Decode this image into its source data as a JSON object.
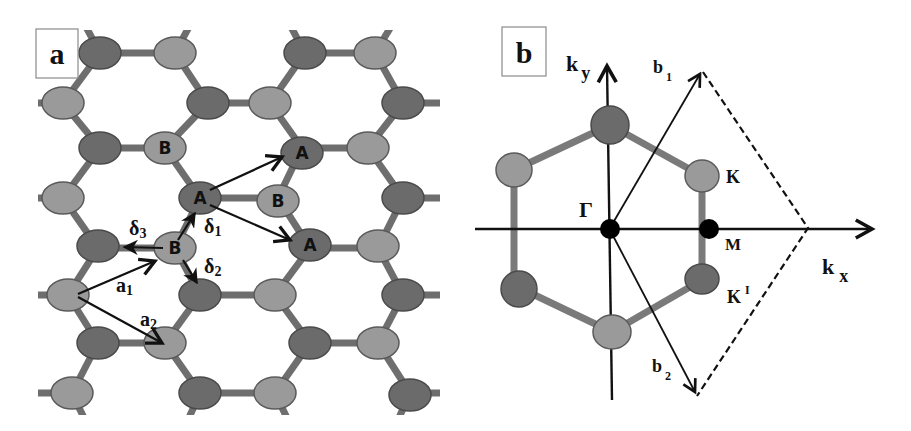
{
  "panel_a": {
    "label": "a",
    "title": "Graphene honeycomb lattice",
    "sublattice_labels": {
      "A": "A",
      "B": "B"
    },
    "vectors": {
      "a1": {
        "base": "a",
        "sub": "1"
      },
      "a2": {
        "base": "a",
        "sub": "2"
      },
      "delta1": {
        "base": "δ",
        "sub": "1"
      },
      "delta2": {
        "base": "δ",
        "sub": "2"
      },
      "delta3": {
        "base": "δ",
        "sub": "3"
      }
    },
    "colors": {
      "atom_dark": "#6b6b6b",
      "atom_light": "#9a9a9a",
      "bond": "#6e6e6e"
    }
  },
  "panel_b": {
    "label": "b",
    "title": "First Brillouin zone",
    "axes": {
      "kx": {
        "base": "k",
        "sub": "x"
      },
      "ky": {
        "base": "k",
        "sub": "y"
      }
    },
    "points": {
      "gamma": "Γ",
      "K": "K",
      "K_prime": "K",
      "K_prime_mark": "I",
      "M": "M"
    },
    "vectors": {
      "b1": {
        "base": "b",
        "sub": "1"
      },
      "b2": {
        "base": "b",
        "sub": "2"
      }
    }
  }
}
